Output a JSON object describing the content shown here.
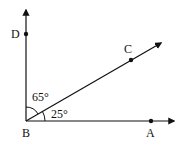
{
  "diagram": {
    "type": "geometry-angles",
    "vertex": {
      "label": "B"
    },
    "points": [
      {
        "label": "D",
        "on_ray": "BD"
      },
      {
        "label": "C",
        "on_ray": "BC"
      },
      {
        "label": "A",
        "on_ray": "BA"
      }
    ],
    "rays": [
      "BD",
      "BC",
      "BA"
    ],
    "angles": [
      {
        "between": "DBC",
        "label": "65°",
        "value": 65
      },
      {
        "between": "CBA",
        "label": "25°",
        "value": 25
      }
    ],
    "colors": {
      "stroke": "#111111",
      "background": "#ffffff"
    }
  }
}
